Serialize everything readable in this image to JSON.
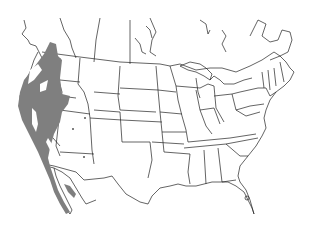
{
  "map": {
    "type": "species range map",
    "region": "North America (USA, southern Canada, northern Mexico)",
    "colors": {
      "background": "#ffffff",
      "boundaries": "#222222",
      "range_fill": "#7f7f7f"
    },
    "range": {
      "description": "Gray shaded range along the Pacific coast and interior west, from southern British Columbia through Washington, Oregon, Idaho, California, Nevada, into Baja California, with small outlying patches in Utah and Arizona and along the Gulf of California coast of Sonora"
    }
  }
}
